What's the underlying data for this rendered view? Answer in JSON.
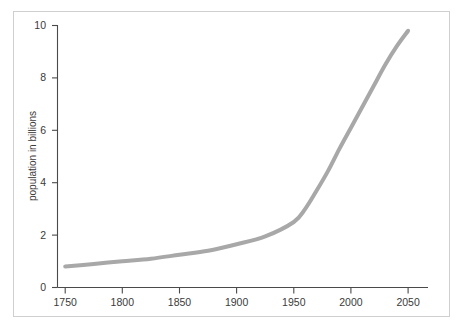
{
  "figure": {
    "background_color": "#ffffff",
    "frame_color": "#cfcfcf",
    "axis_color": "#4a4a4a"
  },
  "axis": {
    "y_title": "population in billions",
    "y_ticks": [
      "0",
      "2",
      "4",
      "6",
      "8",
      "10"
    ],
    "x_ticks": [
      "1750",
      "1800",
      "1850",
      "1900",
      "1950",
      "2000",
      "2050"
    ]
  },
  "chart_data": {
    "type": "line",
    "title": "",
    "subtitle": "",
    "xlabel": "",
    "ylabel": "population in billions",
    "xlim": [
      1750,
      2050
    ],
    "ylim": [
      0,
      10
    ],
    "grid": false,
    "legend": null,
    "series": [
      {
        "name": "world population",
        "color": "#a8a8a8",
        "line_width": 4,
        "x": [
          1750,
          1775,
          1800,
          1825,
          1850,
          1875,
          1900,
          1925,
          1950,
          1960,
          1970,
          1980,
          1990,
          2000,
          2010,
          2020,
          2030,
          2040,
          2050
        ],
        "values": [
          0.8,
          0.9,
          1.0,
          1.1,
          1.25,
          1.4,
          1.65,
          1.95,
          2.5,
          3.0,
          3.7,
          4.45,
          5.3,
          6.1,
          6.9,
          7.7,
          8.5,
          9.2,
          9.8
        ]
      }
    ],
    "x_tick_values": [
      1750,
      1800,
      1850,
      1900,
      1950,
      2000,
      2050
    ],
    "y_tick_values": [
      0,
      2,
      4,
      6,
      8,
      10
    ]
  }
}
